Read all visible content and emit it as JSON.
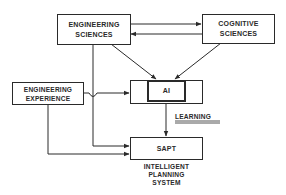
{
  "diagram": {
    "nodes": {
      "engineering_sciences": {
        "line1": "ENGINEERING",
        "line2": "SCIENCES"
      },
      "cognitive_sciences": {
        "line1": "COGNITIVE",
        "line2": "SCIENCES"
      },
      "engineering_experience": {
        "line1": "ENGINEERING",
        "line2": "EXPERIENCE"
      },
      "ai": {
        "label": "AI"
      },
      "sapt": {
        "label": "SAPT"
      }
    },
    "annotations": {
      "learning": "LEARNING",
      "sapt_caption": {
        "line1": "INTELLIGENT",
        "line2": "PLANNING",
        "line3": "SYSTEM"
      }
    },
    "edges": [
      {
        "from": "ENGINEERING SCIENCES",
        "to": "COGNITIVE SCIENCES"
      },
      {
        "from": "COGNITIVE SCIENCES",
        "to": "ENGINEERING SCIENCES"
      },
      {
        "from": "ENGINEERING SCIENCES",
        "to": "AI"
      },
      {
        "from": "COGNITIVE SCIENCES",
        "to": "AI"
      },
      {
        "from": "ENGINEERING EXPERIENCE",
        "to": "AI"
      },
      {
        "from": "ENGINEERING SCIENCES",
        "to": "SAPT"
      },
      {
        "from": "ENGINEERING EXPERIENCE",
        "to": "SAPT"
      },
      {
        "from": "AI",
        "to": "SAPT",
        "label": "LEARNING"
      }
    ],
    "colors": {
      "ink": "#2a2a2a",
      "background": "#ffffff"
    }
  }
}
